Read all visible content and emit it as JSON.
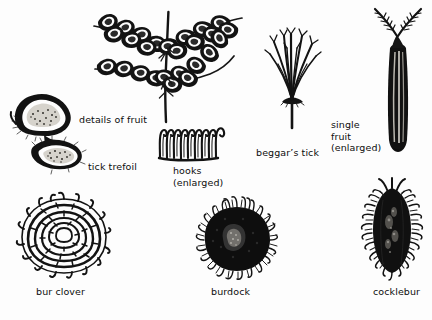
{
  "plate": {
    "title": "hitchhiking fruits and seeds",
    "background_color": "#fdfdfd",
    "ink_color": "#101010",
    "style": "black-and-white stipple line engraving"
  },
  "labels": [
    {
      "id": "details-of-fruit",
      "text": "details of fruit",
      "x": 79,
      "y": 114,
      "align": "left",
      "lines": 1
    },
    {
      "id": "tick-trefoil",
      "text": "tick trefoil",
      "x": 88,
      "y": 161,
      "align": "left",
      "lines": 1
    },
    {
      "id": "hooks-enlarged",
      "text": "hooks\n(enlarged)",
      "x": 173,
      "y": 165,
      "align": "left",
      "lines": 2
    },
    {
      "id": "beggars-tick",
      "text": "beggar’s tick",
      "x": 256,
      "y": 147,
      "align": "left",
      "lines": 1
    },
    {
      "id": "single-fruit",
      "text": "single\nfruit\n(enlarged)",
      "x": 331,
      "y": 119,
      "align": "left",
      "lines": 3
    },
    {
      "id": "bur-clover",
      "text": "bur clover",
      "x": 36,
      "y": 286,
      "align": "left",
      "lines": 1
    },
    {
      "id": "burdock",
      "text": "burdock",
      "x": 211,
      "y": 286,
      "align": "left",
      "lines": 1
    },
    {
      "id": "cocklebur",
      "text": "cocklebur",
      "x": 373,
      "y": 286,
      "align": "left",
      "lines": 1
    }
  ],
  "specimens": [
    {
      "id": "seed-pod-branch",
      "name": "tick trefoil pod branch",
      "label_ref": "details-of-fruit",
      "region": "top-left-center"
    },
    {
      "id": "tick-trefoil-detail",
      "name": "tick trefoil fruit segments",
      "label_ref": "tick-trefoil",
      "region": "left"
    },
    {
      "id": "hooks-detail",
      "name": "hooks enlarged row",
      "label_ref": "hooks-enlarged",
      "region": "center"
    },
    {
      "id": "beggars-tick-fig",
      "name": "beggar's tick bristle spray",
      "label_ref": "beggars-tick",
      "region": "right-center"
    },
    {
      "id": "single-fruit-fig",
      "name": "single fruit with barbed awns",
      "label_ref": "single-fruit",
      "region": "top-right"
    },
    {
      "id": "bur-clover-fig",
      "name": "bur clover spiral bur",
      "label_ref": "bur-clover",
      "region": "bottom-left"
    },
    {
      "id": "burdock-fig",
      "name": "burdock bristly head",
      "label_ref": "burdock",
      "region": "bottom-center"
    },
    {
      "id": "cocklebur-fig",
      "name": "cocklebur hooked bur",
      "label_ref": "cocklebur",
      "region": "bottom-right"
    }
  ]
}
